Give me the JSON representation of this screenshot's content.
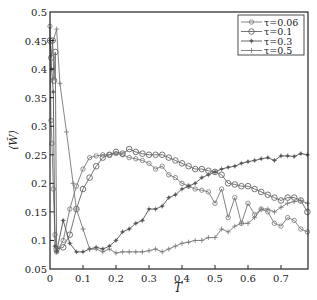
{
  "chart_data": {
    "type": "line",
    "title": "",
    "xlabel": "T",
    "ylabel": "⟨W̃⟩",
    "xlim": [
      0,
      0.79
    ],
    "ylim": [
      0.05,
      0.5
    ],
    "x_ticks": [
      "0",
      "0.1",
      "0.2",
      "0.3",
      "0.4",
      "0.5",
      "0.6",
      "0.7"
    ],
    "y_ticks": [
      "0.05",
      "0.1",
      "0.15",
      "0.2",
      "0.25",
      "0.3",
      "0.35",
      "0.4",
      "0.45",
      "0.5"
    ],
    "grid": false,
    "legend_position": "upper right",
    "series": [
      {
        "name": "τ=0.06",
        "marker": "small-circle",
        "x": [
          0.0,
          0.003,
          0.006,
          0.01,
          0.015,
          0.02,
          0.04,
          0.06,
          0.08,
          0.1,
          0.12,
          0.14,
          0.16,
          0.18,
          0.2,
          0.22,
          0.24,
          0.26,
          0.28,
          0.3,
          0.32,
          0.34,
          0.36,
          0.38,
          0.4,
          0.42,
          0.44,
          0.46,
          0.48,
          0.5,
          0.52,
          0.54,
          0.56,
          0.58,
          0.6,
          0.62,
          0.64,
          0.66,
          0.68,
          0.7,
          0.72,
          0.74,
          0.76,
          0.78
        ],
        "y": [
          0.475,
          0.31,
          0.27,
          0.19,
          0.11,
          0.08,
          0.1,
          0.155,
          0.195,
          0.225,
          0.245,
          0.248,
          0.25,
          0.25,
          0.252,
          0.25,
          0.245,
          0.243,
          0.24,
          0.235,
          0.225,
          0.23,
          0.215,
          0.21,
          0.2,
          0.195,
          0.19,
          0.188,
          0.185,
          0.165,
          0.19,
          0.14,
          0.175,
          0.13,
          0.165,
          0.145,
          0.155,
          0.15,
          0.13,
          0.125,
          0.14,
          0.135,
          0.12,
          0.115
        ]
      },
      {
        "name": "τ=0.1",
        "marker": "circle",
        "x": [
          0.0,
          0.004,
          0.008,
          0.012,
          0.016,
          0.02,
          0.04,
          0.06,
          0.08,
          0.1,
          0.12,
          0.14,
          0.16,
          0.18,
          0.2,
          0.22,
          0.24,
          0.26,
          0.28,
          0.3,
          0.32,
          0.34,
          0.36,
          0.38,
          0.4,
          0.42,
          0.44,
          0.46,
          0.48,
          0.5,
          0.52,
          0.54,
          0.56,
          0.58,
          0.6,
          0.62,
          0.64,
          0.66,
          0.68,
          0.7,
          0.72,
          0.74,
          0.76,
          0.78
        ],
        "y": [
          0.45,
          0.42,
          0.45,
          0.38,
          0.43,
          0.085,
          0.088,
          0.11,
          0.155,
          0.19,
          0.21,
          0.23,
          0.245,
          0.25,
          0.255,
          0.252,
          0.26,
          0.255,
          0.252,
          0.25,
          0.25,
          0.25,
          0.245,
          0.24,
          0.235,
          0.23,
          0.225,
          0.225,
          0.222,
          0.22,
          0.215,
          0.2,
          0.198,
          0.195,
          0.195,
          0.19,
          0.185,
          0.18,
          0.175,
          0.17,
          0.175,
          0.175,
          0.17,
          0.15
        ]
      },
      {
        "name": "τ=0.3",
        "marker": "star",
        "x": [
          0.0,
          0.005,
          0.01,
          0.015,
          0.02,
          0.04,
          0.06,
          0.08,
          0.1,
          0.12,
          0.14,
          0.16,
          0.18,
          0.2,
          0.22,
          0.24,
          0.26,
          0.28,
          0.3,
          0.32,
          0.34,
          0.36,
          0.38,
          0.4,
          0.42,
          0.44,
          0.46,
          0.48,
          0.5,
          0.52,
          0.54,
          0.56,
          0.58,
          0.6,
          0.62,
          0.64,
          0.66,
          0.68,
          0.7,
          0.72,
          0.74,
          0.76,
          0.78
        ],
        "y": [
          0.45,
          0.4,
          0.36,
          0.09,
          0.08,
          0.135,
          0.095,
          0.08,
          0.08,
          0.085,
          0.088,
          0.085,
          0.09,
          0.1,
          0.115,
          0.12,
          0.13,
          0.135,
          0.155,
          0.155,
          0.16,
          0.175,
          0.18,
          0.19,
          0.195,
          0.2,
          0.21,
          0.215,
          0.22,
          0.225,
          0.228,
          0.23,
          0.235,
          0.238,
          0.24,
          0.243,
          0.245,
          0.24,
          0.248,
          0.248,
          0.247,
          0.252,
          0.25
        ]
      },
      {
        "name": "τ=0.5",
        "marker": "plus",
        "x": [
          0.0,
          0.01,
          0.02,
          0.03,
          0.05,
          0.07,
          0.08,
          0.1,
          0.12,
          0.14,
          0.16,
          0.18,
          0.2,
          0.22,
          0.24,
          0.26,
          0.28,
          0.3,
          0.32,
          0.34,
          0.36,
          0.38,
          0.4,
          0.42,
          0.44,
          0.46,
          0.48,
          0.5,
          0.52,
          0.54,
          0.56,
          0.58,
          0.6,
          0.62,
          0.64,
          0.66,
          0.68,
          0.7,
          0.72,
          0.74,
          0.76,
          0.78
        ],
        "y": [
          0.45,
          0.45,
          0.47,
          0.375,
          0.29,
          0.2,
          0.155,
          0.12,
          0.085,
          0.085,
          0.08,
          0.085,
          0.078,
          0.08,
          0.08,
          0.08,
          0.08,
          0.082,
          0.085,
          0.08,
          0.085,
          0.09,
          0.095,
          0.097,
          0.1,
          0.1,
          0.105,
          0.105,
          0.12,
          0.115,
          0.125,
          0.13,
          0.13,
          0.14,
          0.155,
          0.155,
          0.15,
          0.158,
          0.165,
          0.168,
          0.17,
          0.165
        ]
      }
    ]
  },
  "legend": {
    "items": [
      {
        "label": "τ=0.06",
        "marker": "small-circle"
      },
      {
        "label": "τ=0.1",
        "marker": "circle"
      },
      {
        "label": "τ=0.3",
        "marker": "star"
      },
      {
        "label": "τ=0.5",
        "marker": "plus"
      }
    ]
  }
}
